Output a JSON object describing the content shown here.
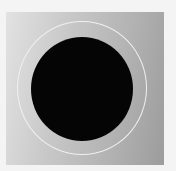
{
  "image": {
    "description": "grayscale image of a black disk surrounded by a thin white ring on a gradient gray background",
    "colors": {
      "background": "#f4f4f4",
      "frame_light": "#e2e2e2",
      "frame_dark": "#9c9c9c",
      "ring": "#f0f0f0",
      "disk": "#050505"
    }
  }
}
